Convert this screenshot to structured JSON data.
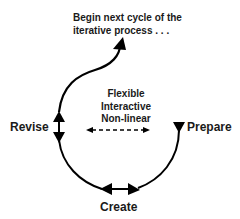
{
  "diagram": {
    "top_note": [
      "Begin next cycle of the",
      "iterative process . . ."
    ],
    "center_note": [
      "Flexible",
      "Interactive",
      "Non-linear"
    ],
    "stages": {
      "revise": "Revise",
      "prepare": "Prepare",
      "create": "Create"
    },
    "colors": {
      "stroke": "#000000",
      "text": "#1a1a1a",
      "background": "#ffffff"
    }
  }
}
